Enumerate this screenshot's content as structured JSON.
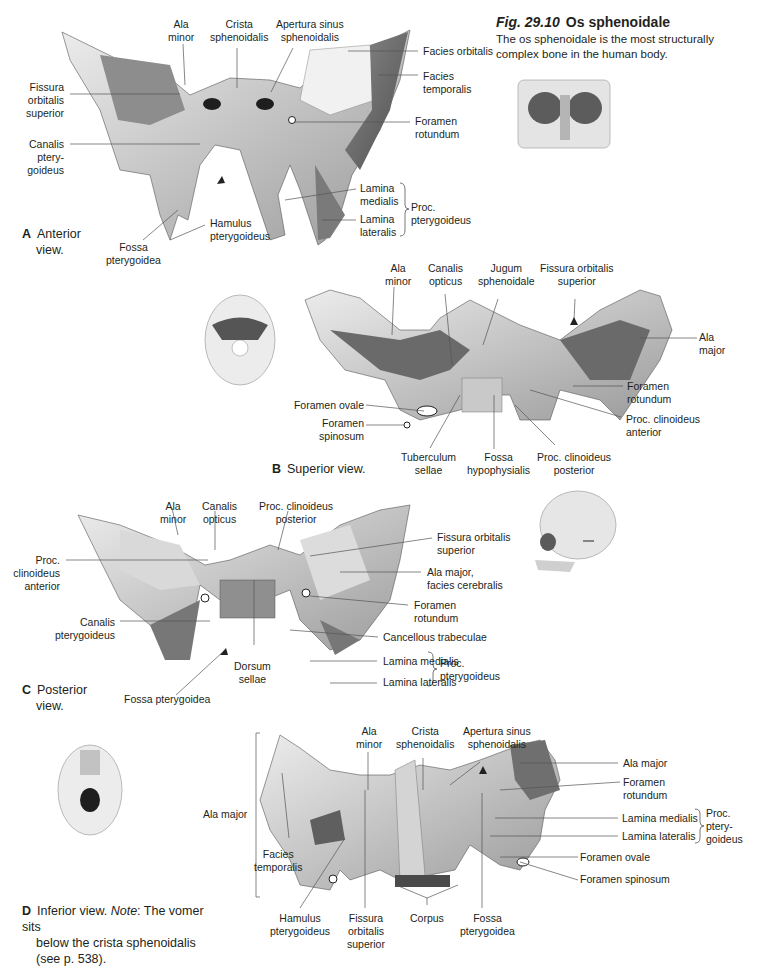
{
  "figure": {
    "number": "Fig. 29.10",
    "title": "Os sphenoidale",
    "description": "The os sphenoidale is the most structurally complex bone in the human body."
  },
  "panels": {
    "A": {
      "letter": "A",
      "caption_line1": "Anterior",
      "caption_line2": "view.",
      "labels": {
        "ala_minor": [
          "Ala",
          "minor"
        ],
        "crista": [
          "Crista",
          "sphenoidalis"
        ],
        "apertura": [
          "Apertura sinus",
          "sphenoidalis"
        ],
        "facies_orbitalis": [
          "Facies orbitalis"
        ],
        "facies_temporalis": [
          "Facies",
          "temporalis"
        ],
        "fissura": [
          "Fissura",
          "orbitalis",
          "superior"
        ],
        "foramen_rotundum": [
          "Foramen",
          "rotundum"
        ],
        "canalis": [
          "Canalis",
          "ptery-",
          "goideus"
        ],
        "lamina_medialis": [
          "Lamina",
          "medialis"
        ],
        "lamina_lateralis": [
          "Lamina",
          "lateralis"
        ],
        "proc": [
          "Proc.",
          "pterygoideus"
        ],
        "hamulus": [
          "Hamulus",
          "pterygoideus"
        ],
        "fossa": [
          "Fossa",
          "pterygoidea"
        ]
      }
    },
    "B": {
      "letter": "B",
      "caption": "Superior view.",
      "labels": {
        "ala_minor": [
          "Ala",
          "minor"
        ],
        "canalis_opticus": [
          "Canalis",
          "opticus"
        ],
        "jugum": [
          "Jugum",
          "sphenoidale"
        ],
        "fissura": [
          "Fissura orbitalis",
          "superior"
        ],
        "ala_major": [
          "Ala",
          "major"
        ],
        "foramen_rotundum": [
          "Foramen",
          "rotundum"
        ],
        "proc_ant": [
          "Proc. clinoideus",
          "anterior"
        ],
        "foramen_ovale": [
          "Foramen ovale"
        ],
        "foramen_spinosum": [
          "Foramen",
          "spinosum"
        ],
        "tuberculum": [
          "Tuberculum",
          "sellae"
        ],
        "fossa_hypo": [
          "Fossa",
          "hypophysialis"
        ],
        "proc_post": [
          "Proc. clinoideus",
          "posterior"
        ]
      }
    },
    "C": {
      "letter": "C",
      "caption_line1": "Posterior",
      "caption_line2": "view.",
      "labels": {
        "ala_minor": [
          "Ala",
          "minor"
        ],
        "canalis_opticus": [
          "Canalis",
          "opticus"
        ],
        "proc_post": [
          "Proc. clinoideus",
          "posterior"
        ],
        "proc_ant": [
          "Proc.",
          "clinoideus",
          "anterior"
        ],
        "fissura": [
          "Fissura orbitalis",
          "superior"
        ],
        "ala_major": [
          "Ala major,",
          "facies cerebralis"
        ],
        "foramen_rotundum": [
          "Foramen",
          "rotundum"
        ],
        "canalis_pteryg": [
          "Canalis",
          "pterygoideus"
        ],
        "cancellous": [
          "Cancellous trabeculae"
        ],
        "lamina_medialis": [
          "Lamina medialis"
        ],
        "lamina_lateralis": [
          "Lamina lateralis"
        ],
        "proc": [
          "Proc.",
          "pterygoideus"
        ],
        "dorsum": [
          "Dorsum",
          "sellae"
        ],
        "fossa": [
          "Fossa pterygoidea"
        ]
      }
    },
    "D": {
      "letter": "D",
      "caption_lead": "Inferior view.",
      "caption_note_label": "Note",
      "caption_line1_rest": ": The vomer sits",
      "caption_line2": "below the crista sphenoidalis",
      "caption_line3": "(see p. 538).",
      "labels": {
        "ala_major_left": [
          "Ala major"
        ],
        "ala_minor": [
          "Ala",
          "minor"
        ],
        "crista": [
          "Crista",
          "sphenoidalis"
        ],
        "apertura": [
          "Apertura sinus",
          "sphenoidalis"
        ],
        "ala_major_right": [
          "Ala major"
        ],
        "foramen_rotundum": [
          "Foramen",
          "rotundum"
        ],
        "lamina_medialis": [
          "Lamina medialis"
        ],
        "lamina_lateralis": [
          "Lamina lateralis"
        ],
        "proc": [
          "Proc.",
          "ptery-",
          "goideus"
        ],
        "foramen_ovale": [
          "Foramen ovale"
        ],
        "foramen_spinosum": [
          "Foramen spinosum"
        ],
        "facies_temporalis": [
          "Facies",
          "temporalis"
        ],
        "hamulus": [
          "Hamulus",
          "pterygoideus"
        ],
        "fissura": [
          "Fissura",
          "orbitalis",
          "superior"
        ],
        "corpus": [
          "Corpus"
        ],
        "fossa": [
          "Fossa",
          "pterygoidea"
        ]
      }
    }
  },
  "colors": {
    "text": "#231f20",
    "bone_light": "#e9e9e9",
    "bone_mid": "#b5b5b5",
    "bone_dark": "#6f6f6f",
    "leader": "#555555"
  }
}
